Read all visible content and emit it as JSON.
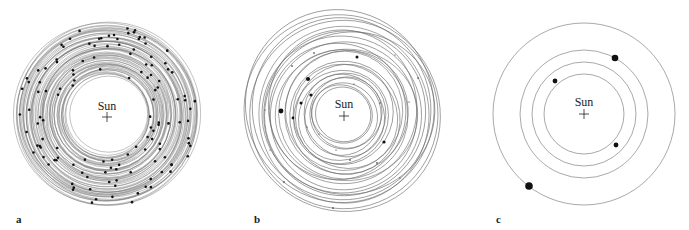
{
  "figure": {
    "panels": [
      {
        "id": "a",
        "label": "a",
        "center_label": "Sun",
        "description": "Many bodies on nearly circular, closely spaced orbits (early planetesimal disk)",
        "orbit_count": 60,
        "body_count": 130
      },
      {
        "id": "b",
        "label": "b",
        "center_label": "Sun",
        "description": "Fewer, larger bodies on eccentric, crossing orbits",
        "orbit_count": 26,
        "body_count": 24
      },
      {
        "id": "c",
        "label": "c",
        "center_label": "Sun",
        "description": "Four planets on well-separated circular orbits",
        "orbit_count": 4,
        "body_count": 4
      }
    ]
  }
}
